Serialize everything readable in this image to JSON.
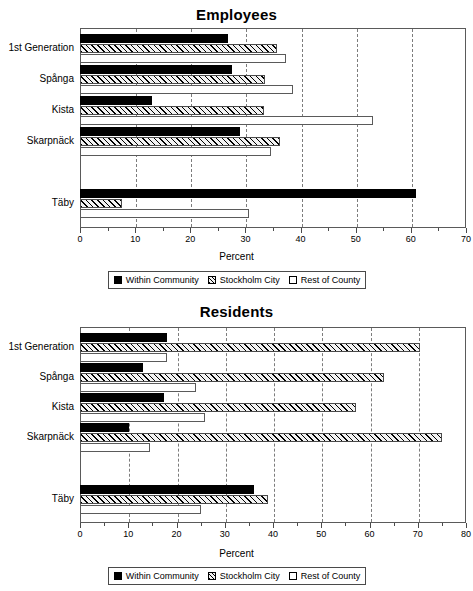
{
  "charts": [
    {
      "id": "employees",
      "title": "Employees",
      "xlabel": "Percent",
      "legend": [
        {
          "label": "Within Community",
          "key": "within"
        },
        {
          "label": "Stockholm City",
          "key": "city"
        },
        {
          "label": "Rest of County",
          "key": "county"
        }
      ],
      "ticks": [
        "0",
        "10",
        "20",
        "30",
        "40",
        "50",
        "60",
        "70"
      ]
    },
    {
      "id": "residents",
      "title": "Residents",
      "xlabel": "Percent",
      "legend": [
        {
          "label": "Within Community",
          "key": "within"
        },
        {
          "label": "Stockholm City",
          "key": "city"
        },
        {
          "label": "Rest of County",
          "key": "county"
        }
      ],
      "ticks": [
        "0",
        "10",
        "20",
        "30",
        "40",
        "50",
        "60",
        "70",
        "80"
      ]
    }
  ],
  "chart_data": [
    {
      "type": "bar",
      "orientation": "horizontal",
      "title": "Employees",
      "xlabel": "Percent",
      "ylabel": "",
      "xlim": [
        0,
        70
      ],
      "xticks": [
        0,
        10,
        20,
        30,
        40,
        50,
        60,
        70
      ],
      "grid": "vertical-dashed",
      "legend_position": "bottom",
      "categories": [
        "1st Generation",
        "Spånga",
        "Kista",
        "Skarpnäck",
        "Täby"
      ],
      "series": [
        {
          "name": "Within Community",
          "values": [
            26.9,
            27.6,
            13.0,
            29.0,
            61.0
          ]
        },
        {
          "name": "Stockholm City",
          "values": [
            35.7,
            33.5,
            33.3,
            36.3,
            7.7
          ]
        },
        {
          "name": "Rest of County",
          "values": [
            37.4,
            38.7,
            53.2,
            34.6,
            30.7
          ]
        }
      ]
    },
    {
      "type": "bar",
      "orientation": "horizontal",
      "title": "Residents",
      "xlabel": "Percent",
      "ylabel": "",
      "xlim": [
        0,
        80
      ],
      "xticks": [
        0,
        10,
        20,
        30,
        40,
        50,
        60,
        70,
        80
      ],
      "grid": "vertical-dashed",
      "legend_position": "bottom",
      "categories": [
        "1st Generation",
        "Spånga",
        "Kista",
        "Skarpnäck",
        "Täby"
      ],
      "series": [
        {
          "name": "Within Community",
          "values": [
            18.0,
            13.0,
            17.5,
            10.2,
            36.1
          ]
        },
        {
          "name": "Stockholm City",
          "values": [
            70.4,
            63.1,
            57.1,
            75.1,
            38.9
          ]
        },
        {
          "name": "Rest of County",
          "values": [
            18.1,
            24.0,
            25.9,
            14.5,
            25.0
          ]
        }
      ]
    }
  ]
}
